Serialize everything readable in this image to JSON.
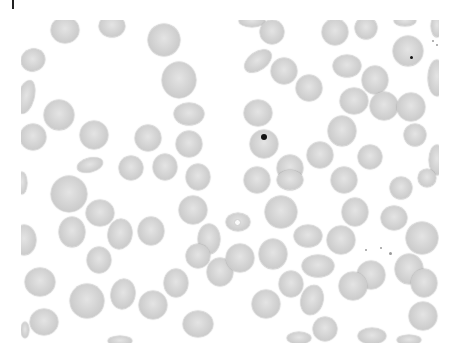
{
  "image": {
    "subject": "blood smear micrograph of red blood cells",
    "background_color": "#ffffff",
    "cell_color": "#d0d0d0",
    "frame": {
      "x": 21,
      "y": 20,
      "width": 418,
      "height": 323
    }
  },
  "cells": [
    {
      "x": 65,
      "y": 30,
      "w": 28,
      "h": 26,
      "r": 0
    },
    {
      "x": 112,
      "y": 26,
      "w": 26,
      "h": 22,
      "r": 0
    },
    {
      "x": 164,
      "y": 40,
      "w": 32,
      "h": 32,
      "r": 0
    },
    {
      "x": 33,
      "y": 60,
      "w": 24,
      "h": 22,
      "r": -20
    },
    {
      "x": 179,
      "y": 80,
      "w": 34,
      "h": 36,
      "r": 0
    },
    {
      "x": 26,
      "y": 97,
      "w": 16,
      "h": 34,
      "r": 15
    },
    {
      "x": 59,
      "y": 115,
      "w": 30,
      "h": 30,
      "r": 0
    },
    {
      "x": 189,
      "y": 114,
      "w": 30,
      "h": 22,
      "r": 0
    },
    {
      "x": 33,
      "y": 137,
      "w": 26,
      "h": 26,
      "r": 0
    },
    {
      "x": 94,
      "y": 135,
      "w": 28,
      "h": 28,
      "r": 0
    },
    {
      "x": 148,
      "y": 138,
      "w": 26,
      "h": 26,
      "r": 0
    },
    {
      "x": 189,
      "y": 144,
      "w": 26,
      "h": 26,
      "r": 0
    },
    {
      "x": 90,
      "y": 165,
      "w": 26,
      "h": 14,
      "r": -15
    },
    {
      "x": 131,
      "y": 168,
      "w": 24,
      "h": 24,
      "r": 0
    },
    {
      "x": 165,
      "y": 167,
      "w": 24,
      "h": 26,
      "r": 0
    },
    {
      "x": 198,
      "y": 177,
      "w": 24,
      "h": 26,
      "r": 0
    },
    {
      "x": 69,
      "y": 194,
      "w": 36,
      "h": 36,
      "r": 0
    },
    {
      "x": 22,
      "y": 183,
      "w": 10,
      "h": 22,
      "r": 0
    },
    {
      "x": 100,
      "y": 213,
      "w": 28,
      "h": 26,
      "r": 0
    },
    {
      "x": 72,
      "y": 232,
      "w": 26,
      "h": 30,
      "r": 0
    },
    {
      "x": 120,
      "y": 234,
      "w": 24,
      "h": 30,
      "r": 10
    },
    {
      "x": 151,
      "y": 231,
      "w": 26,
      "h": 28,
      "r": 0
    },
    {
      "x": 24,
      "y": 240,
      "w": 24,
      "h": 30,
      "r": 0
    },
    {
      "x": 99,
      "y": 260,
      "w": 24,
      "h": 26,
      "r": 0
    },
    {
      "x": 193,
      "y": 210,
      "w": 28,
      "h": 28,
      "r": 0
    },
    {
      "x": 209,
      "y": 239,
      "w": 22,
      "h": 30,
      "r": 0
    },
    {
      "x": 40,
      "y": 282,
      "w": 30,
      "h": 28,
      "r": 0
    },
    {
      "x": 87,
      "y": 301,
      "w": 34,
      "h": 34,
      "r": 0
    },
    {
      "x": 123,
      "y": 294,
      "w": 24,
      "h": 30,
      "r": 10
    },
    {
      "x": 153,
      "y": 305,
      "w": 28,
      "h": 28,
      "r": 0
    },
    {
      "x": 176,
      "y": 283,
      "w": 24,
      "h": 28,
      "r": 0
    },
    {
      "x": 198,
      "y": 256,
      "w": 24,
      "h": 24,
      "r": 0
    },
    {
      "x": 44,
      "y": 322,
      "w": 28,
      "h": 26,
      "r": 0
    },
    {
      "x": 198,
      "y": 324,
      "w": 30,
      "h": 26,
      "r": 0
    },
    {
      "x": 220,
      "y": 272,
      "w": 26,
      "h": 28,
      "r": 0
    },
    {
      "x": 120,
      "y": 341,
      "w": 24,
      "h": 10,
      "r": 0
    },
    {
      "x": 25,
      "y": 330,
      "w": 8,
      "h": 16,
      "r": 0
    },
    {
      "x": 252,
      "y": 21,
      "w": 26,
      "h": 12,
      "r": 0
    },
    {
      "x": 272,
      "y": 32,
      "w": 24,
      "h": 24,
      "r": 0
    },
    {
      "x": 335,
      "y": 32,
      "w": 26,
      "h": 26,
      "r": 0
    },
    {
      "x": 366,
      "y": 28,
      "w": 22,
      "h": 22,
      "r": 0
    },
    {
      "x": 405,
      "y": 21,
      "w": 22,
      "h": 10,
      "r": 0
    },
    {
      "x": 437,
      "y": 26,
      "w": 12,
      "h": 22,
      "r": 0
    },
    {
      "x": 408,
      "y": 51,
      "w": 30,
      "h": 30,
      "r": 0
    },
    {
      "x": 258,
      "y": 61,
      "w": 30,
      "h": 18,
      "r": -35
    },
    {
      "x": 284,
      "y": 71,
      "w": 26,
      "h": 26,
      "r": 0
    },
    {
      "x": 347,
      "y": 66,
      "w": 28,
      "h": 22,
      "r": 0
    },
    {
      "x": 375,
      "y": 80,
      "w": 26,
      "h": 28,
      "r": 0
    },
    {
      "x": 309,
      "y": 88,
      "w": 26,
      "h": 26,
      "r": 0
    },
    {
      "x": 437,
      "y": 78,
      "w": 18,
      "h": 36,
      "r": 0
    },
    {
      "x": 354,
      "y": 101,
      "w": 28,
      "h": 26,
      "r": 0
    },
    {
      "x": 384,
      "y": 106,
      "w": 28,
      "h": 28,
      "r": 0
    },
    {
      "x": 411,
      "y": 107,
      "w": 28,
      "h": 28,
      "r": 0
    },
    {
      "x": 258,
      "y": 113,
      "w": 28,
      "h": 26,
      "r": 0
    },
    {
      "x": 264,
      "y": 144,
      "w": 28,
      "h": 28,
      "r": 0
    },
    {
      "x": 342,
      "y": 131,
      "w": 28,
      "h": 30,
      "r": 0
    },
    {
      "x": 415,
      "y": 135,
      "w": 22,
      "h": 22,
      "r": 0
    },
    {
      "x": 320,
      "y": 155,
      "w": 26,
      "h": 26,
      "r": 0
    },
    {
      "x": 290,
      "y": 168,
      "w": 26,
      "h": 26,
      "r": 0
    },
    {
      "x": 370,
      "y": 157,
      "w": 24,
      "h": 24,
      "r": 0
    },
    {
      "x": 437,
      "y": 160,
      "w": 16,
      "h": 30,
      "r": 0
    },
    {
      "x": 257,
      "y": 180,
      "w": 26,
      "h": 26,
      "r": 0
    },
    {
      "x": 290,
      "y": 180,
      "w": 26,
      "h": 20,
      "r": 0
    },
    {
      "x": 344,
      "y": 180,
      "w": 26,
      "h": 26,
      "r": 0
    },
    {
      "x": 401,
      "y": 188,
      "w": 22,
      "h": 22,
      "r": 0
    },
    {
      "x": 427,
      "y": 178,
      "w": 18,
      "h": 18,
      "r": 0
    },
    {
      "x": 281,
      "y": 212,
      "w": 32,
      "h": 32,
      "r": 0
    },
    {
      "x": 238,
      "y": 222,
      "w": 24,
      "h": 18,
      "r": 0
    },
    {
      "x": 355,
      "y": 212,
      "w": 26,
      "h": 28,
      "r": 0
    },
    {
      "x": 394,
      "y": 218,
      "w": 26,
      "h": 24,
      "r": 0
    },
    {
      "x": 308,
      "y": 236,
      "w": 28,
      "h": 22,
      "r": 0
    },
    {
      "x": 341,
      "y": 240,
      "w": 28,
      "h": 28,
      "r": 0
    },
    {
      "x": 422,
      "y": 238,
      "w": 32,
      "h": 32,
      "r": 0
    },
    {
      "x": 240,
      "y": 258,
      "w": 28,
      "h": 28,
      "r": 0
    },
    {
      "x": 273,
      "y": 254,
      "w": 28,
      "h": 30,
      "r": 0
    },
    {
      "x": 318,
      "y": 266,
      "w": 32,
      "h": 22,
      "r": 0
    },
    {
      "x": 409,
      "y": 269,
      "w": 28,
      "h": 30,
      "r": 0
    },
    {
      "x": 371,
      "y": 275,
      "w": 28,
      "h": 28,
      "r": 0
    },
    {
      "x": 291,
      "y": 284,
      "w": 24,
      "h": 26,
      "r": 0
    },
    {
      "x": 312,
      "y": 300,
      "w": 22,
      "h": 30,
      "r": 15
    },
    {
      "x": 353,
      "y": 286,
      "w": 28,
      "h": 28,
      "r": 0
    },
    {
      "x": 424,
      "y": 283,
      "w": 26,
      "h": 28,
      "r": 0
    },
    {
      "x": 266,
      "y": 304,
      "w": 28,
      "h": 28,
      "r": 0
    },
    {
      "x": 325,
      "y": 329,
      "w": 24,
      "h": 24,
      "r": 0
    },
    {
      "x": 299,
      "y": 338,
      "w": 24,
      "h": 12,
      "r": 0
    },
    {
      "x": 372,
      "y": 336,
      "w": 28,
      "h": 16,
      "r": 0
    },
    {
      "x": 423,
      "y": 316,
      "w": 28,
      "h": 28,
      "r": 0
    },
    {
      "x": 409,
      "y": 340,
      "w": 24,
      "h": 10,
      "r": 0
    }
  ],
  "features": {
    "dark_dot": {
      "x": 264,
      "y": 137,
      "d": 6
    },
    "small_dot": {
      "x": 411,
      "y": 57,
      "d": 3
    },
    "pale_spot": {
      "x": 237,
      "y": 222,
      "d": 7
    },
    "debris": [
      {
        "x": 366,
        "y": 250,
        "d": 2
      },
      {
        "x": 390,
        "y": 253,
        "d": 3
      },
      {
        "x": 381,
        "y": 248,
        "d": 2
      },
      {
        "x": 433,
        "y": 41,
        "d": 2
      },
      {
        "x": 437,
        "y": 45,
        "d": 2
      }
    ]
  }
}
